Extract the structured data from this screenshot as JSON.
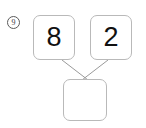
{
  "problem": {
    "number_label": "9",
    "type": "number-bond",
    "addends": [
      {
        "value": "8",
        "name": "left-addend"
      },
      {
        "value": "2",
        "name": "right-addend"
      }
    ],
    "sum": {
      "value": "",
      "name": "sum",
      "is_blank": true
    }
  },
  "colors": {
    "page_background": "#ffffff",
    "box_border": "#b9b9b9",
    "digit": "#111111",
    "connector_line": "#9a9a9a",
    "problem_number_circle": "#5a5a5a",
    "problem_number_text": "#3a3a3a"
  },
  "connectors": [
    {
      "name": "left-addend-to-sum",
      "x1": 62,
      "y1": 60,
      "x2": 88,
      "y2": 80
    },
    {
      "name": "right-addend-to-sum",
      "x1": 108,
      "y1": 60,
      "x2": 82,
      "y2": 80
    }
  ]
}
